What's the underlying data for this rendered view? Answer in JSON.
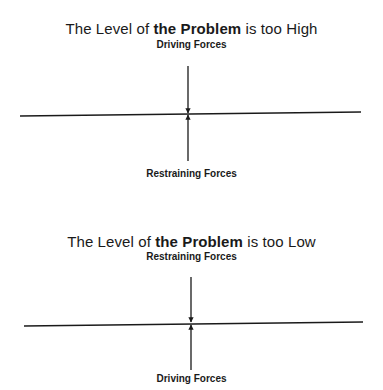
{
  "diagrams": [
    {
      "title": {
        "prefix": "The Level of ",
        "bold": "the Problem",
        "suffix": " is too High"
      },
      "top_label": "Driving Forces",
      "bottom_label": "Restraining Forces"
    },
    {
      "title": {
        "prefix": "The Level of ",
        "bold": "the Problem",
        "suffix": " is too Low"
      },
      "top_label": "Restraining Forces",
      "bottom_label": "Driving Forces"
    }
  ],
  "colors": {
    "ink": "#1a1a1a",
    "background": "#ffffff"
  }
}
